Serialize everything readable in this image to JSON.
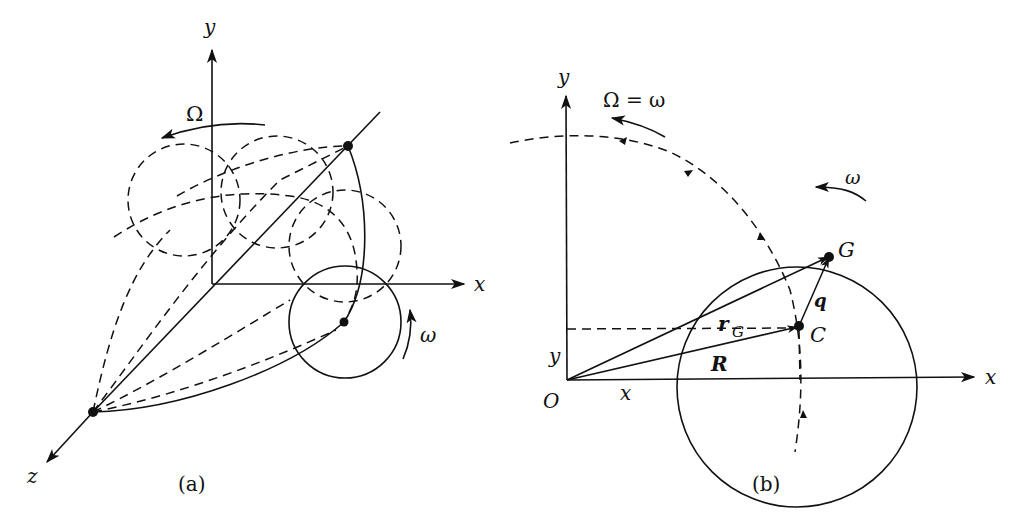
{
  "figure_a": {
    "caption": "(a)",
    "axis_x_label": "x",
    "axis_y_label": "y",
    "axis_z_label": "z",
    "precession_label": "Ω",
    "spin_label": "ω"
  },
  "figure_b": {
    "caption": "(b)",
    "axis_x_label": "x",
    "axis_y_label": "y",
    "origin_label": "O",
    "precession_label": "Ω = ω",
    "spin_label": "ω",
    "point_center_label": "C",
    "point_g_label": "G",
    "vector_q_label": "q",
    "vector_r_label": "r",
    "vector_r_subscript": "G",
    "vector_R_label": "R",
    "coord_x_label": "x",
    "coord_y_label": "y"
  },
  "colors": {
    "ink": "#111111",
    "background": "#ffffff"
  }
}
